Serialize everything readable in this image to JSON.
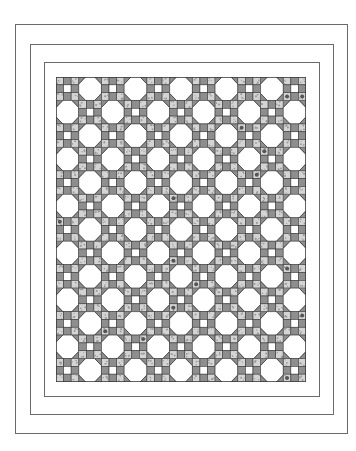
{
  "figure": {
    "borders": [
      {
        "name": "outer-border",
        "x": 15,
        "y": 24,
        "w": 333,
        "h": 410
      },
      {
        "name": "middle-border",
        "x": 30,
        "y": 44,
        "w": 304,
        "h": 371
      },
      {
        "name": "inner-border",
        "x": 44,
        "y": 62,
        "w": 276,
        "h": 335
      }
    ],
    "quilt": {
      "x": 56,
      "y": 77,
      "w": 250,
      "h": 305,
      "columns": 11,
      "rows": 13,
      "pattern": "checkerboard of snowball octagon blocks and nine-patch blocks; octagon where (row+col) is odd",
      "colors": {
        "outline": "#3a3a3a",
        "medium_gray": "#8e8e8e",
        "light_print": "#d4d4d4",
        "white": "#ffffff",
        "border_line": "#6a6a6a"
      }
    }
  }
}
